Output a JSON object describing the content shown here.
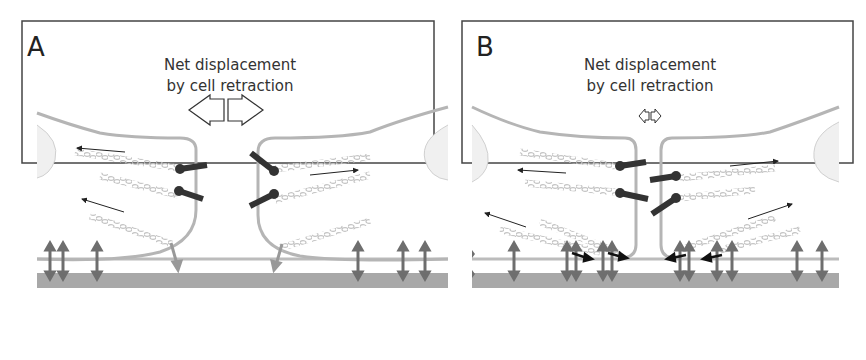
{
  "figure": {
    "panels": [
      {
        "id": "A",
        "label": "A",
        "caption_line1": "Net displacement",
        "caption_line2": "by cell retraction",
        "displacement_arrow_size": "large"
      },
      {
        "id": "B",
        "label": "B",
        "caption_line1": "Net displacement",
        "caption_line2": "by cell retraction",
        "displacement_arrow_size": "small"
      }
    ]
  },
  "colors": {
    "border": "#444444",
    "membrane": "#b5b5b5",
    "substrate": "#a8a8a8",
    "integrin": "#6e6e6e",
    "cadherin": "#333333",
    "actin": "#c8c8c8",
    "arrow": "#222222",
    "nucleus": "#ececec"
  }
}
